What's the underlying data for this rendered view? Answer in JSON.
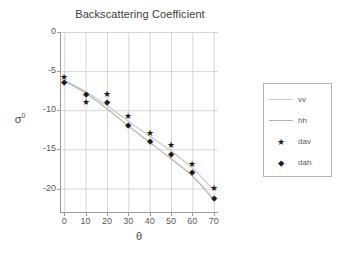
{
  "chart_data": {
    "type": "scatter",
    "title": "Backscattering Coefficient",
    "xlabel": "θ",
    "ylabel": "σ",
    "ylabel_sup": "0",
    "grid": true,
    "xlim": [
      -2,
      72
    ],
    "ylim": [
      -23,
      0
    ],
    "xticks": [
      0,
      10,
      20,
      30,
      40,
      50,
      60,
      70
    ],
    "yticks": [
      0,
      -5,
      -10,
      -15,
      -20
    ],
    "xtick_labels": [
      "0",
      "10",
      "20",
      "30",
      "40",
      "50",
      "60",
      "70"
    ],
    "ytick_labels": [
      "0",
      "-5",
      "-10",
      "-15",
      "-20"
    ],
    "legend_position": "right-outside",
    "x": [
      0,
      10,
      20,
      30,
      40,
      50,
      60,
      70
    ],
    "series": [
      {
        "name": "vv",
        "kind": "line",
        "marker": "none",
        "color": "#c8c8c8",
        "values": [
          -6.2,
          -7.6,
          -9.4,
          -11.4,
          -13.3,
          -15.2,
          -17.4,
          -20.2
        ]
      },
      {
        "name": "hh",
        "kind": "line",
        "marker": "none",
        "color": "#b4b4b4",
        "values": [
          -6.2,
          -7.8,
          -9.8,
          -12.0,
          -14.1,
          -16.2,
          -18.4,
          -21.4
        ]
      },
      {
        "name": "dav",
        "kind": "scatter",
        "marker": "star",
        "marker_glyph": "★",
        "color": "#1c1c1c",
        "values": [
          -5.8,
          -9.0,
          -8.0,
          -10.8,
          -13.0,
          -14.5,
          -16.9,
          -20.0
        ]
      },
      {
        "name": "dah",
        "kind": "scatter",
        "marker": "diamond",
        "marker_glyph": "⬥",
        "color": "#1c1c1c",
        "values": [
          -6.4,
          -8.0,
          -9.0,
          -11.9,
          -14.0,
          -15.6,
          -18.0,
          -21.3
        ]
      }
    ]
  },
  "legend": {
    "entries": [
      {
        "label": "vv",
        "type": "line",
        "color": "#c8c8c8"
      },
      {
        "label": "hh",
        "type": "line",
        "color": "#b4b4b4"
      },
      {
        "label": "dav",
        "type": "marker",
        "glyph": "★",
        "color": "#1c1c1c"
      },
      {
        "label": "dah",
        "type": "marker",
        "glyph": "⬥",
        "color": "#1c1c1c"
      }
    ]
  },
  "colors": {
    "background": "#ffffff",
    "axis": "#9a9a9a",
    "grid": "#d6d6d6",
    "text": "#4a4a4a",
    "marker": "#1c1c1c"
  }
}
